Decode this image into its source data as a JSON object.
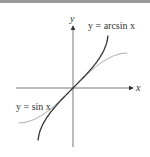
{
  "figure": {
    "axis_x_label": "x",
    "axis_y_label": "y",
    "curves": [
      {
        "name": "arcsin",
        "label": "y = arcsin x",
        "color": "#333333"
      },
      {
        "name": "sin",
        "label": "y = sin x",
        "color": "#aaaaaa"
      }
    ]
  }
}
